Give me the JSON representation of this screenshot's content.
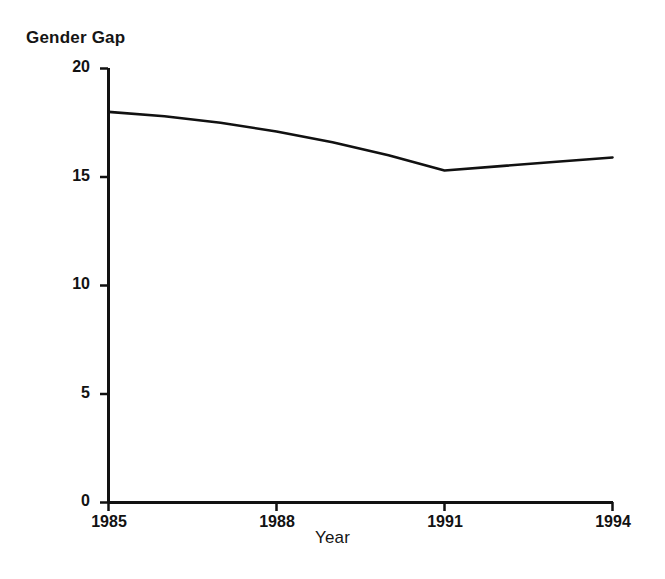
{
  "chart_data": {
    "type": "line",
    "title": "",
    "xlabel": "Year",
    "ylabel": "Gender Gap",
    "x": [
      1985,
      1986,
      1987,
      1988,
      1989,
      1990,
      1991,
      1992,
      1993,
      1994
    ],
    "values": [
      18.0,
      17.8,
      17.5,
      17.1,
      16.6,
      16.0,
      15.3,
      15.5,
      15.7,
      15.9
    ],
    "series": [
      {
        "name": "Gender Gap",
        "values": [
          18.0,
          17.8,
          17.5,
          17.1,
          16.6,
          16.0,
          15.3,
          15.5,
          15.7,
          15.9
        ]
      }
    ],
    "xlim": [
      1985,
      1994
    ],
    "ylim": [
      0,
      20
    ],
    "ytick_labels": [
      "0",
      "5",
      "10",
      "15",
      "20"
    ],
    "ytick_values": [
      0,
      5,
      10,
      15,
      20
    ],
    "xtick_labels": [
      "1985",
      "1988",
      "1991",
      "1994"
    ],
    "xtick_values": [
      1985,
      1988,
      1991,
      1994
    ],
    "grid": false,
    "legend": false,
    "line_color": "#111111",
    "axis_color": "#111111"
  },
  "labels": {
    "y_axis_title": "Gender Gap",
    "x_axis_title": "Year"
  }
}
